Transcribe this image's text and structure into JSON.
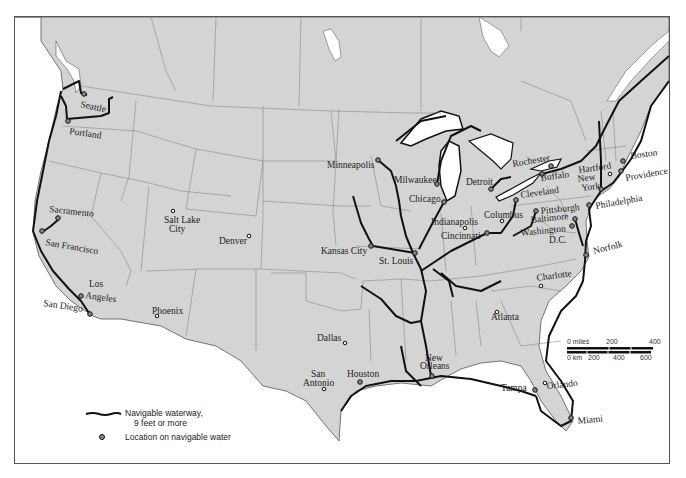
{
  "map": {
    "title": "Navigable waterways of the United States",
    "colors": {
      "land": "#d4d4d4",
      "water": "#ffffff",
      "border": "#888888",
      "waterway": "#111111",
      "frame": "#555555"
    }
  },
  "cities": [
    {
      "name": "Seattle",
      "x": 83,
      "y": 93,
      "navigable": true
    },
    {
      "name": "Portland",
      "x": 67,
      "y": 120,
      "navigable": true
    },
    {
      "name": "Sacramento",
      "x": 57,
      "y": 217,
      "navigable": true
    },
    {
      "name": "San Francisco",
      "x": 41,
      "y": 230,
      "navigable": true
    },
    {
      "name": "Los Angeles",
      "x": 80,
      "y": 295,
      "navigable": true
    },
    {
      "name": "San Diego",
      "x": 89,
      "y": 313,
      "navigable": true
    },
    {
      "name": "Salt Lake City",
      "x": 172,
      "y": 210,
      "navigable": false
    },
    {
      "name": "Denver",
      "x": 248,
      "y": 235,
      "navigable": false
    },
    {
      "name": "Phoenix",
      "x": 156,
      "y": 315,
      "navigable": false
    },
    {
      "name": "Minneapolis",
      "x": 377,
      "y": 159,
      "navigable": true
    },
    {
      "name": "Milwaukee",
      "x": 436,
      "y": 183,
      "navigable": true
    },
    {
      "name": "Chicago",
      "x": 443,
      "y": 201,
      "navigable": true
    },
    {
      "name": "Detroit",
      "x": 490,
      "y": 188,
      "navigable": true
    },
    {
      "name": "Kansas City",
      "x": 370,
      "y": 245,
      "navigable": true
    },
    {
      "name": "St. Louis",
      "x": 414,
      "y": 252,
      "navigable": true
    },
    {
      "name": "Indianapolis",
      "x": 464,
      "y": 227,
      "navigable": false
    },
    {
      "name": "Cincinnati",
      "x": 486,
      "y": 232,
      "navigable": true
    },
    {
      "name": "Columbus",
      "x": 501,
      "y": 220,
      "navigable": false
    },
    {
      "name": "Cleveland",
      "x": 515,
      "y": 199,
      "navigable": true
    },
    {
      "name": "Pittsburgh",
      "x": 535,
      "y": 210,
      "navigable": true
    },
    {
      "name": "Rochester",
      "x": 550,
      "y": 165,
      "navigable": true
    },
    {
      "name": "Buffalo",
      "x": 541,
      "y": 173,
      "navigable": true
    },
    {
      "name": "Hartford",
      "x": 609,
      "y": 173,
      "navigable": false
    },
    {
      "name": "New York",
      "x": 600,
      "y": 188,
      "navigable": true
    },
    {
      "name": "Boston",
      "x": 622,
      "y": 160,
      "navigable": true
    },
    {
      "name": "Providence",
      "x": 620,
      "y": 170,
      "navigable": true
    },
    {
      "name": "Philadelphia",
      "x": 588,
      "y": 204,
      "navigable": true
    },
    {
      "name": "Baltimore",
      "x": 574,
      "y": 218,
      "navigable": true
    },
    {
      "name": "Washington D.C.",
      "x": 571,
      "y": 225,
      "navigable": true
    },
    {
      "name": "Norfolk",
      "x": 585,
      "y": 254,
      "navigable": true
    },
    {
      "name": "Charlotte",
      "x": 540,
      "y": 285,
      "navigable": false
    },
    {
      "name": "Atlanta",
      "x": 496,
      "y": 311,
      "navigable": false
    },
    {
      "name": "Dallas",
      "x": 344,
      "y": 342,
      "navigable": false
    },
    {
      "name": "San Antonio",
      "x": 323,
      "y": 388,
      "navigable": false
    },
    {
      "name": "Houston",
      "x": 359,
      "y": 381,
      "navigable": true
    },
    {
      "name": "New Orleans",
      "x": 431,
      "y": 375,
      "navigable": true
    },
    {
      "name": "Tampa",
      "x": 534,
      "y": 389,
      "navigable": true
    },
    {
      "name": "Orlando",
      "x": 544,
      "y": 382,
      "navigable": false
    },
    {
      "name": "Miami",
      "x": 570,
      "y": 417,
      "navigable": true
    }
  ],
  "labels": {
    "seattle": "Seattle",
    "portland": "Portland",
    "sacramento": "Sacramento",
    "san_francisco": "San Francisco",
    "los": "Los",
    "angeles": "Angeles",
    "san_diego": "San Diego",
    "salt_lake": "Salt Lake",
    "city": "City",
    "denver": "Denver",
    "phoenix": "Phoenix",
    "minneapolis": "Minneapolis",
    "milwaukee": "Milwaukee",
    "chicago": "Chicago",
    "detroit": "Detroit",
    "kansas_city": "Kansas City",
    "st_louis": "St. Louis",
    "indianapolis": "Indianapolis",
    "cincinnati": "Cincinnati",
    "columbus": "Columbus",
    "cleveland": "Cleveland",
    "pittsburgh": "Pittsburgh",
    "rochester": "Rochester",
    "buffalo": "Buffalo",
    "hartford": "Hartford",
    "new": "New",
    "york": "York",
    "boston": "Boston",
    "providence": "Providence",
    "philadelphia": "Philadelphia",
    "baltimore": "Baltimore",
    "washington": "Washington",
    "dc": "D.C.",
    "norfolk": "Norfolk",
    "charlotte": "Charlotte",
    "atlanta": "Atlanta",
    "dallas": "Dallas",
    "san": "San",
    "antonio": "Antonio",
    "houston": "Houston",
    "orleans": "Orleans",
    "tampa": "Tampa",
    "orlando": "Orlando",
    "miami": "Miami"
  },
  "legend": {
    "waterway_label_line1": "Navigable waterway,",
    "waterway_label_line2": "9 feet or more",
    "location_label": "Location on navigable water"
  },
  "scale": {
    "miles_label": "0 miles",
    "miles_200": "200",
    "miles_400": "400",
    "km_label": "0 km",
    "km_200": "200",
    "km_400": "400",
    "km_600": "600"
  }
}
